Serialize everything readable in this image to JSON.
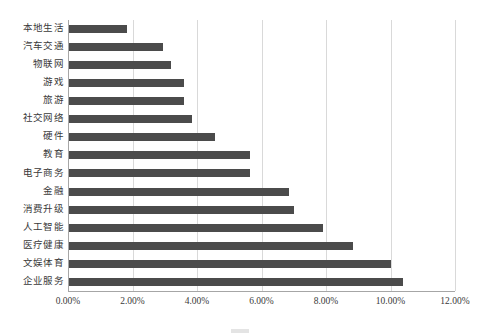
{
  "chart_data": {
    "type": "bar",
    "orientation": "horizontal",
    "title": "",
    "xlabel": "",
    "ylabel": "",
    "xlim": [
      0,
      12
    ],
    "x_unit": "%",
    "grid": true,
    "legend": "none",
    "bar_color": "#4b4b4b",
    "gridline_color": "#d9d9d9",
    "axis_color": "#a6a6a6",
    "xticks": [
      0,
      2,
      4,
      6,
      8,
      10,
      12
    ],
    "xtick_labels": [
      "0.00%",
      "2.00%",
      "4.00%",
      "6.00%",
      "8.00%",
      "10.00%",
      "12.00%"
    ],
    "categories": [
      "本地生活",
      "汽车交通",
      "物联网",
      "游戏",
      "旅游",
      "社交网络",
      "硬件",
      "教育",
      "电子商务",
      "金融",
      "消费升级",
      "人工智能",
      "医疗健康",
      "文娱体育",
      "企业服务"
    ],
    "values": [
      1.83,
      2.95,
      3.2,
      3.6,
      3.6,
      3.85,
      4.55,
      5.65,
      5.65,
      6.85,
      7.0,
      7.9,
      8.85,
      10.0,
      10.4
    ],
    "value_labels": [
      "1.83%",
      "2.95%",
      "3.20%",
      "3.60%",
      "3.60%",
      "3.85%",
      "4.55%",
      "5.65%",
      "5.65%",
      "6.85%",
      "7.00%",
      "7.90%",
      "8.85%",
      "10.00%",
      "10.40%"
    ]
  },
  "caption": {
    "text": ""
  }
}
